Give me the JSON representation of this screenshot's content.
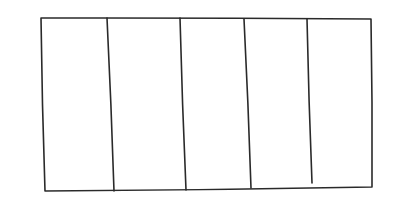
{
  "diagram": {
    "type": "hand-drawn-sketch",
    "stroke_color": "#2a2a2a",
    "background_color": "#ffffff",
    "column_count": 5,
    "outer_rect": {
      "top_left": [
        41,
        18
      ],
      "top_right": [
        371,
        19
      ],
      "bottom_right": [
        372,
        187
      ],
      "bottom_left": [
        45,
        191
      ]
    },
    "dividers": [
      {
        "top": [
          107,
          18
        ],
        "bottom": [
          114,
          191
        ]
      },
      {
        "top": [
          180,
          18
        ],
        "bottom": [
          186,
          190
        ]
      },
      {
        "top": [
          244,
          19
        ],
        "bottom": [
          251,
          188
        ]
      },
      {
        "top": [
          307,
          19
        ],
        "bottom": [
          312,
          183
        ]
      }
    ]
  }
}
